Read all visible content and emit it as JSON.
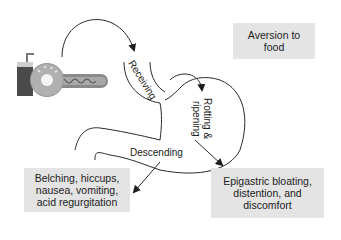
{
  "diagram": {
    "boxes": {
      "aversion": "Aversion to\nfood",
      "belching": "Belching, hiccups,\nnausea, vomiting,\nacid regurgitation",
      "epigastric": "Epigastric bloating,\ndistention, and\ndiscomfort"
    },
    "stages": {
      "receiving": "Receiving",
      "rotting": "Rotting &",
      "ripening": "ripening",
      "descending": "Descending"
    },
    "icons": [
      "food-drink-icon"
    ],
    "colors": {
      "box_fill": "#e4e4e4",
      "line": "#2a2a2a",
      "cup": "#4a4a4a",
      "donut": "#9a9a9a",
      "hotdog": "#888888"
    }
  }
}
